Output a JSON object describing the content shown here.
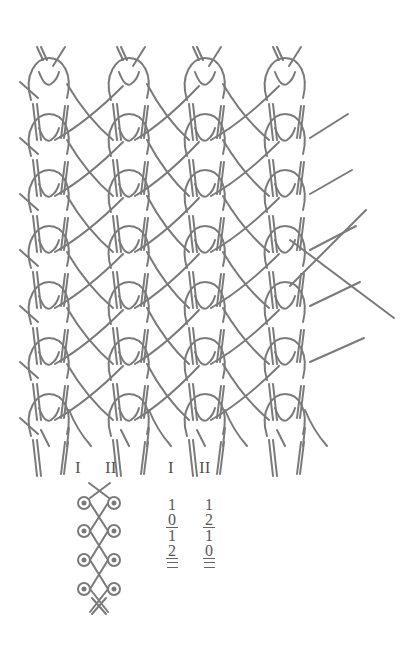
{
  "figure": {
    "type": "warp-knit structure diagram",
    "wales": 4,
    "courses": 7,
    "stroke_color": "#777777",
    "background": "#ffffff"
  },
  "guide_bar_labels": {
    "diagram": {
      "bar1": "I",
      "bar2": "II"
    },
    "notation": {
      "bar1": "I",
      "bar2": "II"
    }
  },
  "lapping_notation": {
    "bar_I": [
      "1",
      "0",
      "1",
      "2"
    ],
    "bar_II": [
      "1",
      "2",
      "1",
      "0"
    ]
  }
}
